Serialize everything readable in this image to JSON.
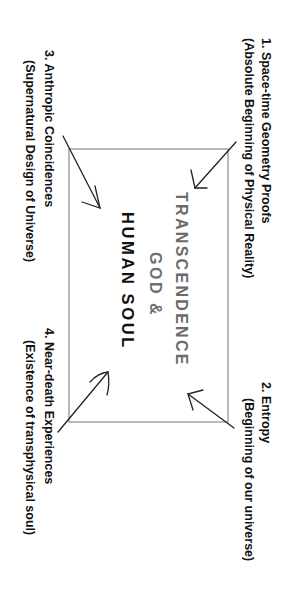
{
  "diagram": {
    "orientation": "rotated 90 degrees clockwise",
    "center": {
      "line1": "TRANSCENDENCE",
      "line2": "GOD &",
      "line3": "HUMAN SOUL",
      "colors": {
        "line1": "#6a6a6a",
        "line2": "#707070",
        "line3": "#111111"
      }
    },
    "nodes": [
      {
        "id": "1",
        "title": "1. Space-time Geometry Proofs",
        "subtitle": "(Absolute Beginning of Physical Reality)"
      },
      {
        "id": "2",
        "title": "2. Entropy",
        "subtitle": "(Beginning of our universe)"
      },
      {
        "id": "3",
        "title": "3. Anthropic Coincidences",
        "subtitle": "(Supernatural Design of Universe)"
      },
      {
        "id": "4",
        "title": "4. Near-death Experiences",
        "subtitle": "(Existence of transphysical soul)"
      }
    ],
    "colors": {
      "stroke": "#222222",
      "box": "#8a8a8a",
      "text": "#111111"
    }
  }
}
